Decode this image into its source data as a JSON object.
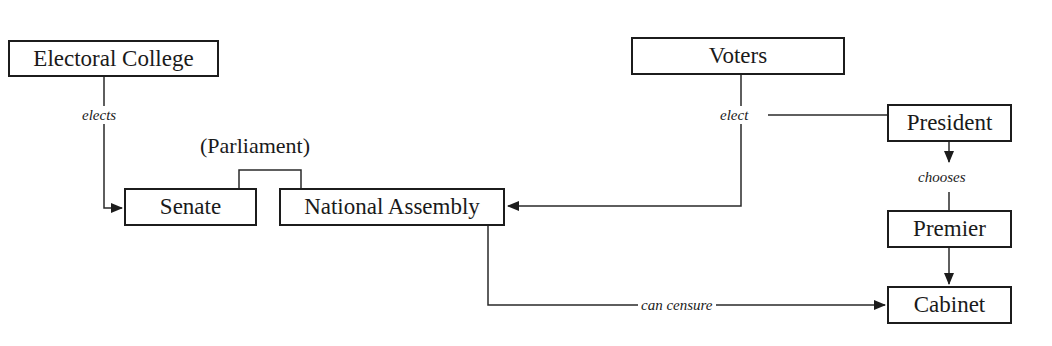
{
  "diagram": {
    "group_label": "(Parliament)",
    "nodes": {
      "electoral_college": "Electoral College",
      "senate": "Senate",
      "national_assembly": "National Assembly",
      "voters": "Voters",
      "president": "President",
      "premier": "Premier",
      "cabinet": "Cabinet"
    },
    "edges": [
      {
        "from": "Electoral College",
        "to": "Senate",
        "label": "elects"
      },
      {
        "from": "Voters",
        "to": "National Assembly",
        "label": "elect"
      },
      {
        "from": "Voters",
        "to": "President",
        "label": "elect"
      },
      {
        "from": "President",
        "to": "Premier",
        "label": "chooses"
      },
      {
        "from": "Premier",
        "to": "Cabinet",
        "label": ""
      },
      {
        "from": "National Assembly",
        "to": "Cabinet",
        "label": "can censure"
      }
    ],
    "edge_labels": {
      "elects": "elects",
      "elect": "elect",
      "chooses": "chooses",
      "can_censure": "can censure"
    }
  }
}
